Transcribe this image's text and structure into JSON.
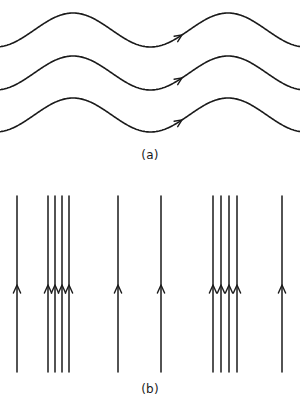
{
  "figure": {
    "title": "",
    "background_color": "#ffffff",
    "stroke_color": "#1a1a1a",
    "width": 300,
    "height": 406
  },
  "panels": [
    {
      "id": "a",
      "label": "(a)",
      "description": "three parallel sinusoidal streamlines with rightward flow arrows"
    },
    {
      "id": "b",
      "label": "(b)",
      "description": "twelve vertical streamlines in alternating isolated and clustered groups with upward flow arrows"
    }
  ],
  "chart_data": {
    "type": "line",
    "title": "",
    "xlabel": "",
    "ylabel": "",
    "grid": false,
    "legend_position": "none",
    "panel_a": {
      "type": "line",
      "curve": "sinusoid",
      "count": 3,
      "x_start": 0,
      "x_end": 300,
      "wavelength": 155,
      "amplitude": 17,
      "phase_x_of_first_crest": 73,
      "baselines": [
        30,
        73,
        115
      ],
      "crests_y": [
        13,
        55,
        98
      ],
      "troughs_y": [
        48,
        90,
        133
      ],
      "arrow_x": 182,
      "arrow_direction": "right",
      "arrows_y": [
        33,
        75,
        118
      ]
    },
    "panel_b": {
      "type": "line",
      "orientation": "vertical",
      "count": 12,
      "y_top": 196,
      "y_bottom": 372,
      "arrow_y": 285,
      "arrow_direction": "up",
      "x_positions": [
        17,
        48,
        55,
        62,
        69,
        118,
        161,
        213,
        221,
        229,
        237,
        282
      ],
      "groups": [
        {
          "name": "isolated-left",
          "x": [
            17
          ]
        },
        {
          "name": "cluster-left",
          "x": [
            48,
            55,
            62,
            69
          ]
        },
        {
          "name": "isolated-mid-left",
          "x": [
            118
          ]
        },
        {
          "name": "isolated-mid-right",
          "x": [
            161
          ]
        },
        {
          "name": "cluster-right",
          "x": [
            213,
            221,
            229,
            237
          ]
        },
        {
          "name": "isolated-right",
          "x": [
            282
          ]
        }
      ]
    }
  }
}
